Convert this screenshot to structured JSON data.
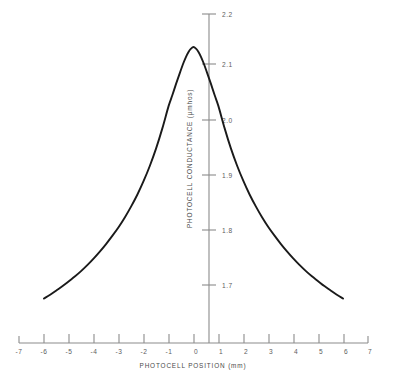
{
  "chart_data": {
    "type": "line",
    "title": "",
    "subtitle": "",
    "xlabel": "PHOTOCELL POSITION (mm)",
    "ylabel": "PHOTOCELL CONDUCTANCE (µmhos)",
    "xlim": [
      -7,
      7
    ],
    "ylim": [
      1.65,
      2.2
    ],
    "grid": false,
    "legend": null,
    "xticks": [
      -7,
      -6,
      -5,
      -4,
      -3,
      -2,
      -1,
      0,
      1,
      2,
      3,
      4,
      5,
      6,
      7
    ],
    "xticklabels": [
      "-7",
      "-6",
      "-5",
      "-4",
      "-3",
      "-2",
      "-1",
      "0",
      "1",
      "2",
      "3",
      "4",
      "5",
      "6",
      "7"
    ],
    "yticks": [
      1.7,
      1.8,
      1.9,
      2.0,
      2.1,
      2.2
    ],
    "yticklabels": [
      "1.7",
      "1.8",
      "1.9",
      "2.0",
      "2.1",
      "2.2"
    ],
    "ytick_label_side": "right",
    "axis_color": "#8b8b8b",
    "curve_color": "#1a1a1a",
    "background_color": "#ffffff",
    "series": [
      {
        "name": "photocell response",
        "x": [
          -6.0,
          -5.75,
          -5.5,
          -5.25,
          -5.0,
          -4.75,
          -4.5,
          -4.25,
          -4.0,
          -3.75,
          -3.5,
          -3.25,
          -3.0,
          -2.75,
          -2.5,
          -2.25,
          -2.0,
          -1.75,
          -1.5,
          -1.25,
          -1.0,
          -0.85,
          -0.7,
          -0.55,
          -0.4,
          -0.3,
          -0.2,
          -0.1,
          0.0,
          0.1,
          0.2,
          0.3,
          0.4,
          0.55,
          0.7,
          0.85,
          1.0,
          1.25,
          1.5,
          1.75,
          2.0,
          2.25,
          2.5,
          2.75,
          3.0,
          3.25,
          3.5,
          3.75,
          4.0,
          4.25,
          4.5,
          4.75,
          5.0,
          5.25,
          5.5,
          5.75,
          6.0
        ],
        "y": [
          1.675,
          1.682,
          1.69,
          1.698,
          1.707,
          1.716,
          1.726,
          1.737,
          1.749,
          1.762,
          1.776,
          1.791,
          1.807,
          1.825,
          1.845,
          1.867,
          1.892,
          1.92,
          1.952,
          1.989,
          2.03,
          2.05,
          2.071,
          2.091,
          2.11,
          2.121,
          2.13,
          2.136,
          2.139,
          2.136,
          2.13,
          2.121,
          2.11,
          2.091,
          2.071,
          2.05,
          2.03,
          1.989,
          1.952,
          1.92,
          1.892,
          1.867,
          1.845,
          1.825,
          1.807,
          1.791,
          1.776,
          1.762,
          1.749,
          1.737,
          1.726,
          1.716,
          1.707,
          1.698,
          1.69,
          1.682,
          1.675
        ]
      }
    ],
    "peak": {
      "x": 0.0,
      "y": 2.139
    }
  }
}
